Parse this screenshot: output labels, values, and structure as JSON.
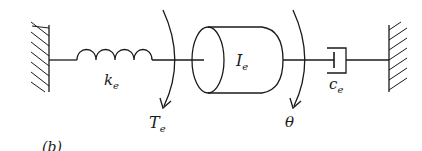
{
  "diagram": {
    "type": "torsional mass-spring-damper",
    "figure_label": "(b)",
    "labels": {
      "spring": {
        "base": "k",
        "sub": "e"
      },
      "inertia": {
        "base": "I",
        "sub": "e"
      },
      "damper": {
        "base": "c",
        "sub": "e"
      },
      "torque": {
        "base": "T",
        "sub": "e"
      },
      "angle": {
        "base": "θ"
      }
    },
    "colors": {
      "stroke": "#1a1a1a",
      "background": "#ffffff"
    }
  }
}
